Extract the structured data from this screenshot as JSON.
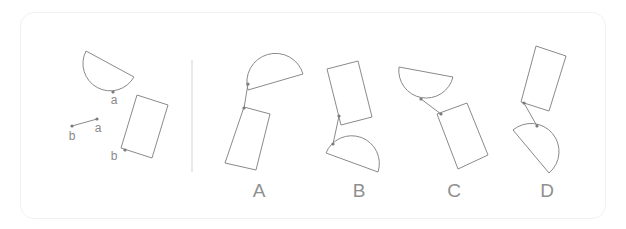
{
  "question": {
    "reference": {
      "segment_labels": {
        "start": "b",
        "end": "a"
      },
      "semicircle_point_label": "a",
      "rectangle_point_label": "b"
    },
    "options": [
      {
        "id": "A",
        "label": "A"
      },
      {
        "id": "B",
        "label": "B"
      },
      {
        "id": "C",
        "label": "C"
      },
      {
        "id": "D",
        "label": "D"
      }
    ]
  },
  "colors": {
    "stroke": "#8a8a8a",
    "label": "#8f8f8f",
    "divider": "#e2e2e2",
    "panel_border": "#f1f1f1"
  }
}
